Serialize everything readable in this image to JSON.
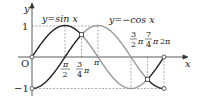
{
  "chart_data": {
    "type": "line",
    "title": "",
    "xlabel": "x",
    "ylabel": "y",
    "origin_label": "O",
    "xlim": [
      0,
      6.2832
    ],
    "ylim": [
      -1,
      1
    ],
    "y_ticks": [
      {
        "value": 1,
        "label": "1"
      },
      {
        "value": -1,
        "label": "−1"
      }
    ],
    "x_ticks": [
      {
        "value": 1.5708,
        "label_num": "π",
        "label_den": "2",
        "label_suffix": ""
      },
      {
        "value": 2.3562,
        "label_num": "3",
        "label_den": "4",
        "label_suffix": "π"
      },
      {
        "value": 3.1416,
        "label": "π"
      },
      {
        "value": 4.7124,
        "label_num": "3",
        "label_den": "2",
        "label_suffix": "π"
      },
      {
        "value": 5.4978,
        "label_num": "7",
        "label_den": "4",
        "label_suffix": "π"
      },
      {
        "value": 6.2832,
        "label": "2π"
      }
    ],
    "series": [
      {
        "name": "y = sin x",
        "label": "y = sin x",
        "function": "sin"
      },
      {
        "name": "y = −cos x",
        "label": "y = −cos x",
        "function": "-cos"
      }
    ],
    "intersections": [
      {
        "x": 2.3562,
        "y": 0.7071
      },
      {
        "x": 5.4978,
        "y": -0.7071
      }
    ],
    "highlighted_intervals": [
      [
        0,
        2.3562
      ],
      [
        5.4978,
        6.2832
      ]
    ],
    "colors": {
      "highlight": "#222222",
      "normal": "#9a9a9a",
      "dashed": "#888888"
    }
  },
  "labels": {
    "sin_label": "y=sin x",
    "negcos_label": "y=−cos x",
    "y_axis": "y",
    "x_axis": "x",
    "origin": "O",
    "one": "1",
    "minus_one": "−1",
    "pi_half_num": "π",
    "pi_half_den": "2",
    "three_quarter_num": "3",
    "three_quarter_den": "4",
    "pi_suffix": "π",
    "pi": "π",
    "three_half_num": "3",
    "three_half_den": "2",
    "seven_quarter_num": "7",
    "seven_quarter_den": "4",
    "two_pi": "2π"
  }
}
